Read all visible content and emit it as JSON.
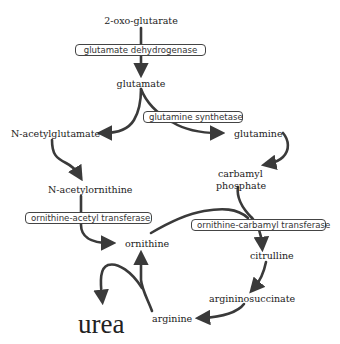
{
  "diagram": {
    "title": "",
    "metabolites": {
      "oxoglutarate": "2-oxo-glutarate",
      "glutamate": "glutamate",
      "n_acetylglutamate": "N-acetylglutamate",
      "glutamine": "glutamine",
      "carbamyl_phosphate_line1": "carbamyl",
      "carbamyl_phosphate_line2": "phosphate",
      "n_acetylornithine": "N-acetylornithine",
      "ornithine": "ornithine",
      "citrulline": "citrulline",
      "argininosuccinate": "argininosuccinate",
      "arginine": "arginine",
      "urea": "urea"
    },
    "enzymes": {
      "glutamate_dehydrogenase": "glutamate dehydrogenase",
      "glutamine_synthetase": "glutamine synthetase",
      "ornithine_acetyl_transferase": "ornithine-acetyl transferase",
      "ornithine_carbamyl_transferase": "ornithine-carbamyl transferase"
    },
    "edges": [
      {
        "from": "2-oxo-glutarate",
        "to": "glutamate",
        "enzyme": "glutamate dehydrogenase"
      },
      {
        "from": "glutamate",
        "to": "N-acetylglutamate"
      },
      {
        "from": "glutamate",
        "to": "glutamine",
        "enzyme": "glutamine synthetase"
      },
      {
        "from": "N-acetylglutamate",
        "to": "N-acetylornithine"
      },
      {
        "from": "glutamine",
        "to": "carbamyl phosphate"
      },
      {
        "from": "N-acetylornithine",
        "to": "ornithine",
        "enzyme": "ornithine-acetyl transferase"
      },
      {
        "from": "ornithine",
        "to": "citrulline",
        "enzyme": "ornithine-carbamyl transferase"
      },
      {
        "from": "carbamyl phosphate",
        "to": "citrulline",
        "enzyme": "ornithine-carbamyl transferase"
      },
      {
        "from": "citrulline",
        "to": "argininosuccinate"
      },
      {
        "from": "argininosuccinate",
        "to": "arginine"
      },
      {
        "from": "arginine",
        "to": "ornithine"
      },
      {
        "from": "arginine",
        "to": "urea"
      }
    ],
    "colors": {
      "line": "#3a3a3a",
      "text": "#222222",
      "background": "#ffffff"
    }
  }
}
